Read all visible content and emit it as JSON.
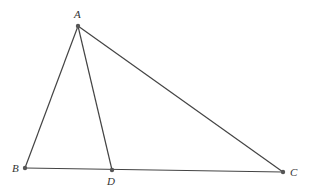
{
  "diagram": {
    "type": "triangle",
    "points": [
      {
        "name": "A",
        "label": "A"
      },
      {
        "name": "B",
        "label": "B"
      },
      {
        "name": "C",
        "label": "C"
      },
      {
        "name": "D",
        "label": "D"
      }
    ],
    "segments": [
      {
        "from": "A",
        "to": "B"
      },
      {
        "from": "A",
        "to": "C"
      },
      {
        "from": "B",
        "to": "C"
      },
      {
        "from": "A",
        "to": "D"
      }
    ]
  }
}
